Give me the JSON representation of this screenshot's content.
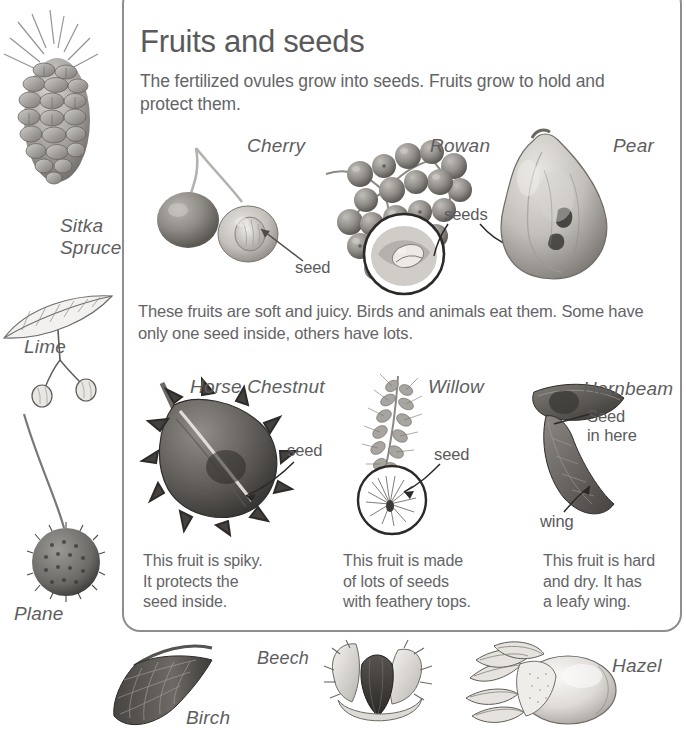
{
  "page": {
    "title": "Fruits and seeds",
    "intro": "The fertilized ovules grow into seeds. Fruits grow to hold and protect them.",
    "middle_text": "These fruits are soft and juicy. Birds and animals eat them. Some have only one seed inside, others have lots.",
    "text_color": "#646466",
    "frame_color": "#8e8e90"
  },
  "sidebar": {
    "items": [
      {
        "label": "Sitka\nSpruce",
        "name": "sitka-spruce"
      },
      {
        "label": "Lime",
        "name": "lime"
      },
      {
        "label": "Plane",
        "name": "plane"
      }
    ],
    "sitka_line1": "Sitka",
    "sitka_line2": "Spruce",
    "lime": "Lime",
    "plane": "Plane"
  },
  "row_fleshy": {
    "specimens": [
      {
        "label": "Cherry"
      },
      {
        "label": "Rowan"
      },
      {
        "label": "Pear"
      }
    ],
    "callouts": [
      {
        "text": "seed"
      },
      {
        "text": "seeds"
      }
    ]
  },
  "row_dry": {
    "specimens": [
      {
        "label": "Horse Chestnut"
      },
      {
        "label": "Willow"
      },
      {
        "label": "Hornbeam"
      }
    ],
    "callouts": [
      {
        "text": "seed"
      },
      {
        "text": "seed"
      },
      {
        "text": "Seed"
      },
      {
        "text": "in here"
      },
      {
        "text": "wing"
      }
    ],
    "captions": [
      "This fruit is spiky. It protects the seed inside.",
      "This fruit is made of lots of seeds with feathery tops.",
      "This fruit is hard and dry. It has a leafy wing."
    ],
    "caption1_l1": "This fruit is spiky.",
    "caption1_l2": "It protects the",
    "caption1_l3": "seed inside.",
    "caption2_l1": "This fruit is made",
    "caption2_l2": "of lots of seeds",
    "caption2_l3": "with feathery tops.",
    "caption3_l1": "This fruit is hard",
    "caption3_l2": "and dry. It has",
    "caption3_l3": "a leafy wing."
  },
  "row_bottom": {
    "specimens": [
      {
        "label": "Birch"
      },
      {
        "label": "Beech"
      },
      {
        "label": "Hazel"
      }
    ]
  }
}
